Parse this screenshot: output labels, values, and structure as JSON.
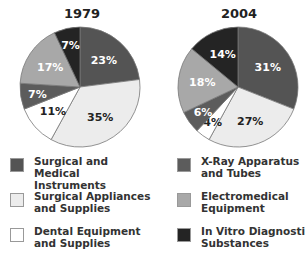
{
  "chart_data": [
    {
      "type": "pie",
      "title": "1979",
      "categories": [
        "Surgical and Medical Instruments",
        "Surgical Appliances and Supplies",
        "Dental Equipment and Supplies",
        "X-Ray Apparatus and Tubes",
        "Electromedical Equipment",
        "In Vitro Diagnostic Substances"
      ],
      "values": [
        23,
        35,
        11,
        7,
        17,
        7
      ],
      "labels": [
        "23%",
        "35%",
        "11%",
        "7%",
        "17%",
        "7%"
      ]
    },
    {
      "type": "pie",
      "title": "2004",
      "categories": [
        "Surgical and Medical Instruments",
        "Surgical Appliances and Supplies",
        "Dental Equipment and Supplies",
        "X-Ray Apparatus and Tubes",
        "Electromedical Equipment",
        "In Vitro Diagnostic Substances"
      ],
      "values": [
        31,
        27,
        4,
        6,
        18,
        14
      ],
      "labels": [
        "31%",
        "27%",
        "4%",
        "6%",
        "18%",
        "14%"
      ]
    }
  ],
  "colors": [
    "#545454",
    "#ececec",
    "#ffffff",
    "#5c5c5c",
    "#a8a8a8",
    "#242424"
  ],
  "label_colors": [
    "#ffffff",
    "#222222",
    "#222222",
    "#ffffff",
    "#ffffff",
    "#ffffff"
  ],
  "legend": [
    {
      "label": "Surgical and\nMedical Instruments",
      "color": "#545454"
    },
    {
      "label": "X-Ray Apparatus\nand Tubes",
      "color": "#5c5c5c"
    },
    {
      "label": "Surgical Appliances\nand Supplies",
      "color": "#ececec"
    },
    {
      "label": "Electromedical\nEquipment",
      "color": "#a8a8a8"
    },
    {
      "label": "Dental Equipment\nand Supplies",
      "color": "#ffffff"
    },
    {
      "label": "In Vitro Diagnostic\nSubstances",
      "color": "#242424"
    }
  ]
}
